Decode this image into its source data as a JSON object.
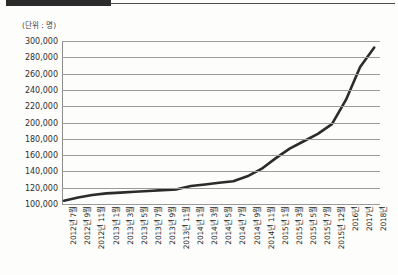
{
  "header": {
    "bar_label": "",
    "has_rule": true
  },
  "chart_data": {
    "type": "line",
    "title": "",
    "subtitle": "",
    "unit_label": "(단위 : 명)",
    "xlabel": "",
    "ylabel": "",
    "grid": true,
    "legend": "none",
    "line_color": "#2b2b2b",
    "grid_color": "#9a9a9a",
    "ylim": [
      100000,
      300000
    ],
    "yticks": [
      300000,
      280000,
      260000,
      240000,
      220000,
      200000,
      180000,
      160000,
      140000,
      120000,
      100000
    ],
    "ytick_labels": [
      "300,000",
      "280,000",
      "260,000",
      "240,000",
      "220,000",
      "200,000",
      "180,000",
      "160,000",
      "140,000",
      "120,000",
      "100,000"
    ],
    "categories": [
      "2012년 7월",
      "2012년 9월",
      "2012년 11월",
      "2013년 1월",
      "2013년 3월",
      "2013년 5월",
      "2013년 7월",
      "2013년 9월",
      "2013년 11월",
      "2014년 1월",
      "2014년 3월",
      "2014년 5월",
      "2014년 7월",
      "2014년 9월",
      "2014년 11월",
      "2015년 1월",
      "2015년 3월",
      "2015년 5월",
      "2015년 7월",
      "2015년 12월",
      "2016년",
      "2017년",
      "2018년"
    ],
    "values": [
      104000,
      108000,
      111000,
      113000,
      114000,
      115000,
      116000,
      117000,
      118000,
      122000,
      124000,
      126000,
      128000,
      134000,
      143000,
      156000,
      168000,
      177000,
      186000,
      198000,
      228000,
      268000,
      292000
    ],
    "series": [
      {
        "name": "누적 인원",
        "values": [
          104000,
          108000,
          111000,
          113000,
          114000,
          115000,
          116000,
          117000,
          118000,
          122000,
          124000,
          126000,
          128000,
          134000,
          143000,
          156000,
          168000,
          177000,
          186000,
          198000,
          228000,
          268000,
          292000
        ]
      }
    ]
  }
}
